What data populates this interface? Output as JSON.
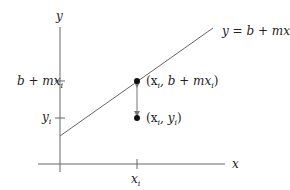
{
  "diagram": {
    "title": "",
    "axes": {
      "x_label": "x",
      "y_label": "y"
    },
    "line": {
      "equation": "y = b + mx"
    },
    "ticks": {
      "y_upper": {
        "main": "b + mx",
        "sub": "i"
      },
      "y_lower": {
        "main": "y",
        "sub": "i"
      },
      "x": {
        "main": "x",
        "sub": "i"
      }
    },
    "points": [
      {
        "label_open": "(x",
        "label_sub": "i",
        "label_rest": ", b + mx",
        "label_sub2": "i",
        "label_close": ")",
        "full": "(x_i, b + mx_i)"
      },
      {
        "label_open": "(x",
        "label_sub": "i",
        "label_rest": ", y",
        "label_sub2": "i",
        "label_close": ")",
        "full": "(x_i, y_i)"
      }
    ],
    "colors": {
      "axis": "#555555",
      "line": "#555555",
      "point": "#111111",
      "arrow": "#777777",
      "text": "#222222"
    }
  }
}
